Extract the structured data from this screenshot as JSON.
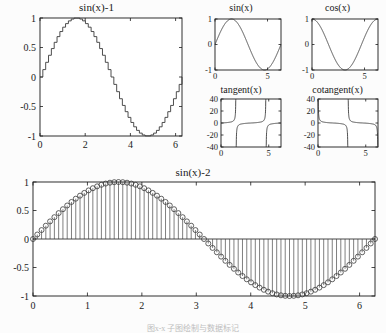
{
  "figure": {
    "background_color": "#fcfcfc",
    "axis_color": "#1a1a1a",
    "curve_color": "#3a3a3a",
    "caption": "图x-x 子图绘制与数据标记"
  },
  "chart_data": [
    {
      "id": "stairs-sin",
      "type": "line",
      "style": "stairs",
      "title": "sin(x)-1",
      "xlabel": "",
      "ylabel": "",
      "xlim": [
        0,
        6.2832
      ],
      "ylim": [
        -1,
        1
      ],
      "xticks": [
        0,
        2,
        4,
        6
      ],
      "xticklabels": [
        "0",
        "2",
        "4",
        "6"
      ],
      "yticks": [
        -1,
        -0.5,
        0,
        0.5,
        1
      ],
      "yticklabels": [
        "-1",
        "-0.5",
        "0",
        "0.5",
        "1"
      ],
      "grid": false,
      "legend": "none",
      "samples": 50,
      "expression": "sin(x)"
    },
    {
      "id": "sin",
      "type": "line",
      "style": "solid",
      "title": "sin(x)",
      "xlabel": "",
      "ylabel": "",
      "xlim": [
        0,
        6.2832
      ],
      "ylim": [
        -1,
        1
      ],
      "xticks": [
        0,
        5
      ],
      "xticklabels": [
        "0",
        "5"
      ],
      "yticks": [
        -1,
        0,
        1
      ],
      "yticklabels": [
        "-1",
        "0",
        "1"
      ],
      "grid": false,
      "legend": "none",
      "expression": "sin(x)"
    },
    {
      "id": "cos",
      "type": "line",
      "style": "solid",
      "title": "cos(x)",
      "xlabel": "",
      "ylabel": "",
      "xlim": [
        0,
        6.2832
      ],
      "ylim": [
        -1,
        1
      ],
      "xticks": [
        0,
        5
      ],
      "xticklabels": [
        "0",
        "5"
      ],
      "yticks": [
        -1,
        0,
        1
      ],
      "yticklabels": [
        "-1",
        "0",
        "1"
      ],
      "grid": false,
      "legend": "none",
      "expression": "cos(x)"
    },
    {
      "id": "tangent",
      "type": "line",
      "style": "solid",
      "title": "tangent(x)",
      "xlabel": "",
      "ylabel": "",
      "xlim": [
        0,
        6.2832
      ],
      "ylim": [
        -40,
        40
      ],
      "xticks": [
        0,
        5
      ],
      "xticklabels": [
        "0",
        "5"
      ],
      "yticks": [
        -40,
        -20,
        0,
        20,
        40
      ],
      "yticklabels": [
        "-40",
        "-20",
        "0",
        "20",
        "40"
      ],
      "grid": false,
      "legend": "none",
      "expression": "tan(x)",
      "asymptotes": [
        1.5708,
        4.7124
      ]
    },
    {
      "id": "cotangent",
      "type": "line",
      "style": "solid",
      "title": "cotangent(x)",
      "xlabel": "",
      "ylabel": "",
      "xlim": [
        0,
        6.2832
      ],
      "ylim": [
        -40,
        40
      ],
      "xticks": [
        0,
        5
      ],
      "xticklabels": [
        "0",
        "5"
      ],
      "yticks": [
        -40,
        -20,
        0,
        20,
        40
      ],
      "yticklabels": [
        "-40",
        "-20",
        "0",
        "20",
        "40"
      ],
      "grid": false,
      "legend": "none",
      "expression": "cot(x)",
      "asymptotes": [
        3.1416
      ]
    },
    {
      "id": "stem-sin",
      "type": "stem",
      "style": "stem-circle",
      "title": "sin(x)-2",
      "xlabel": "",
      "ylabel": "",
      "xlim": [
        0,
        6.2832
      ],
      "ylim": [
        -1,
        1
      ],
      "xticks": [
        0,
        1,
        2,
        3,
        4,
        5,
        6
      ],
      "xticklabels": [
        "0",
        "1",
        "2",
        "3",
        "4",
        "5",
        "6"
      ],
      "yticks": [
        -1,
        -0.5,
        0,
        0.5,
        1
      ],
      "yticklabels": [
        "-1",
        "-0.5",
        "0",
        "0.5",
        "1"
      ],
      "grid": false,
      "legend": "none",
      "samples": 80,
      "expression": "sin(x)"
    }
  ]
}
